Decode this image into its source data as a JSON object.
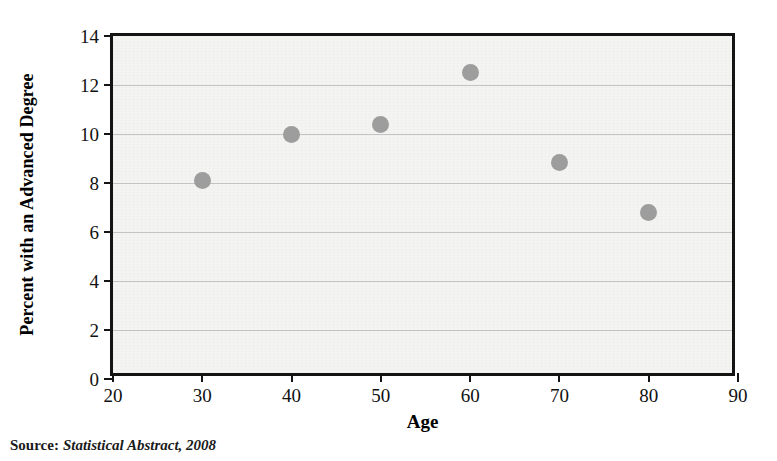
{
  "chart_data": {
    "type": "scatter",
    "title": "",
    "xlabel": "Age",
    "ylabel": "Percent with an Advanced Degree",
    "xlim": [
      20,
      90
    ],
    "ylim": [
      0,
      14
    ],
    "xticks": [
      20,
      30,
      40,
      50,
      60,
      70,
      80,
      90
    ],
    "xtick_labels": [
      "20",
      "30",
      "40",
      "50",
      "60",
      "70",
      "80",
      "90"
    ],
    "yticks": [
      0,
      2,
      4,
      6,
      8,
      10,
      12,
      14
    ],
    "ytick_labels": [
      "0",
      "2",
      "4",
      "6",
      "8",
      "10",
      "12",
      "14"
    ],
    "grid": "horizontal",
    "legend": "none",
    "marker_color": "#9d9d9d",
    "plot_background": "#f4f4f3",
    "frame_color": "#141414",
    "gridline_color": "#c3c3c3",
    "x": [
      30,
      40,
      50,
      60,
      70,
      80
    ],
    "y": [
      8.1,
      10.0,
      10.4,
      12.5,
      8.85,
      6.8
    ],
    "points": [
      {
        "x": 30,
        "y": 8.1
      },
      {
        "x": 40,
        "y": 10.0
      },
      {
        "x": 50,
        "y": 10.4
      },
      {
        "x": 60,
        "y": 12.5
      },
      {
        "x": 70,
        "y": 8.85
      },
      {
        "x": 80,
        "y": 6.8
      }
    ]
  },
  "source": {
    "prefix": "Source:",
    "title": "Statistical Abstract, 2008"
  }
}
